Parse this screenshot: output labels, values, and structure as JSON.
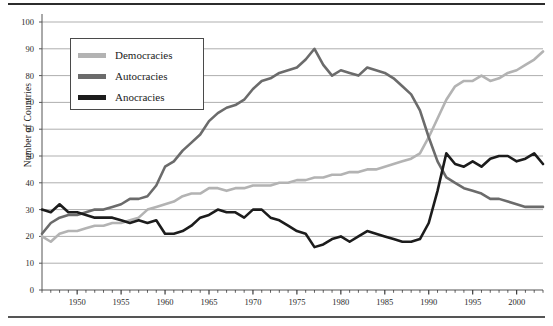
{
  "chart_data": {
    "type": "line",
    "title": "",
    "subtitle": "",
    "xlabel": "",
    "ylabel": "Number of Countries",
    "xlim": [
      1946,
      2003
    ],
    "ylim": [
      0,
      100
    ],
    "grid": true,
    "grid_axis": "y",
    "legend_position": "upper-left-inside",
    "ytick_labels": [
      "0",
      "10",
      "20",
      "30",
      "40",
      "50",
      "60",
      "70",
      "80",
      "90",
      "100"
    ],
    "ytick_values": [
      0,
      10,
      20,
      30,
      40,
      50,
      60,
      70,
      80,
      90,
      100
    ],
    "xtick_labels": [
      "1950",
      "1955",
      "1960",
      "1965",
      "1970",
      "1975",
      "1980",
      "1985",
      "1990",
      "1995",
      "2000"
    ],
    "xtick_values": [
      1950,
      1955,
      1960,
      1965,
      1970,
      1975,
      1980,
      1985,
      1990,
      1995,
      2000
    ],
    "x_minor_tick_interval": 1,
    "x": [
      1946,
      1947,
      1948,
      1949,
      1950,
      1951,
      1952,
      1953,
      1954,
      1955,
      1956,
      1957,
      1958,
      1959,
      1960,
      1961,
      1962,
      1963,
      1964,
      1965,
      1966,
      1967,
      1968,
      1969,
      1970,
      1971,
      1972,
      1973,
      1974,
      1975,
      1976,
      1977,
      1978,
      1979,
      1980,
      1981,
      1982,
      1983,
      1984,
      1985,
      1986,
      1987,
      1988,
      1989,
      1990,
      1991,
      1992,
      1993,
      1994,
      1995,
      1996,
      1997,
      1998,
      1999,
      2000,
      2001,
      2002,
      2003
    ],
    "series": [
      {
        "name": "Democracies",
        "color": "#b3b3b3",
        "values": [
          20,
          18,
          21,
          22,
          22,
          23,
          24,
          24,
          25,
          25,
          26,
          27,
          30,
          31,
          32,
          33,
          35,
          36,
          36,
          38,
          38,
          37,
          38,
          38,
          39,
          39,
          39,
          40,
          40,
          41,
          41,
          42,
          42,
          43,
          43,
          44,
          44,
          45,
          45,
          46,
          47,
          48,
          49,
          51,
          57,
          64,
          71,
          76,
          78,
          78,
          80,
          78,
          79,
          81,
          82,
          84,
          86,
          89
        ]
      },
      {
        "name": "Autocracies",
        "color": "#6b6b6b",
        "values": [
          21,
          25,
          27,
          28,
          28,
          29,
          30,
          30,
          31,
          32,
          34,
          34,
          35,
          39,
          46,
          48,
          52,
          55,
          58,
          63,
          66,
          68,
          69,
          71,
          75,
          78,
          79,
          81,
          82,
          83,
          86,
          90,
          84,
          80,
          82,
          81,
          80,
          83,
          82,
          81,
          79,
          76,
          73,
          67,
          57,
          48,
          42,
          40,
          38,
          37,
          36,
          34,
          34,
          33,
          32,
          31,
          31,
          31
        ]
      },
      {
        "name": "Anocracies",
        "color": "#1c1c1c",
        "values": [
          30,
          29,
          32,
          29,
          29,
          28,
          27,
          27,
          27,
          26,
          25,
          26,
          25,
          26,
          21,
          21,
          22,
          24,
          27,
          28,
          30,
          29,
          29,
          27,
          30,
          30,
          27,
          26,
          24,
          22,
          21,
          16,
          17,
          19,
          20,
          18,
          20,
          22,
          21,
          20,
          19,
          18,
          18,
          19,
          25,
          37,
          51,
          47,
          46,
          48,
          46,
          49,
          50,
          50,
          48,
          49,
          51,
          47
        ]
      }
    ]
  },
  "legend": {
    "entries": [
      {
        "label": "Democracies"
      },
      {
        "label": "Autocracies"
      },
      {
        "label": "Anocracies"
      }
    ]
  },
  "axes": {
    "y_axis_title": "Number of Countries"
  },
  "footnote": {
    "text": ""
  }
}
